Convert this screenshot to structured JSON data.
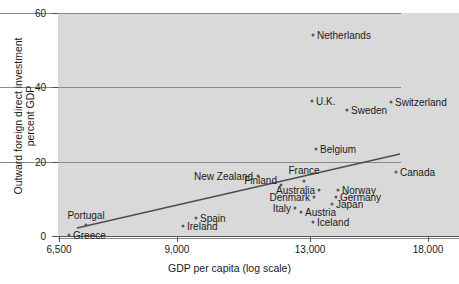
{
  "chart_data": {
    "type": "scatter",
    "title": "",
    "xlabel": "GDP per capita (log scale)",
    "ylabel": "Outward foreign direct investment\npercent GDP",
    "ylabel_line1": "Outward foreign direct investment",
    "ylabel_line2": "percent GDP",
    "xscale": "log",
    "xlim": [
      6500,
      19800
    ],
    "ylim": [
      0,
      60
    ],
    "xticks": [
      6500,
      9000,
      13000,
      18000
    ],
    "xticklabels": [
      "6,500",
      "9,000",
      "13,000",
      "18,000"
    ],
    "yticks": [
      0,
      20,
      40,
      60
    ],
    "yticklabels": [
      "0",
      "20",
      "40",
      "60"
    ],
    "grid": "horizontal",
    "legend": "none",
    "points": [
      {
        "label": "Netherlands",
        "x": 13000,
        "y": 54.0,
        "lx": 313,
        "ly": 35,
        "tx": 317,
        "ty": 35,
        "anchor": "l"
      },
      {
        "label": "U.K.",
        "x": 12970,
        "y": 36.3,
        "lx": 312,
        "ly": 101,
        "tx": 316,
        "ty": 101,
        "anchor": "l"
      },
      {
        "label": "Switzerland",
        "x": 16480,
        "y": 36.0,
        "lx": 391,
        "ly": 102,
        "tx": 395,
        "ty": 102,
        "anchor": "l"
      },
      {
        "label": "Sweden",
        "x": 14320,
        "y": 33.9,
        "lx": 347,
        "ly": 110,
        "tx": 351,
        "ty": 110,
        "anchor": "l"
      },
      {
        "label": "Belgium",
        "x": 13120,
        "y": 23.4,
        "lx": 316,
        "ly": 149,
        "tx": 320,
        "ty": 149,
        "anchor": "l"
      },
      {
        "label": "New Zealand",
        "x": 11090,
        "y": 16.1,
        "lx": 258,
        "ly": 176,
        "tx": 253,
        "ty": 176,
        "anchor": "r"
      },
      {
        "label": "Canada",
        "x": 16790,
        "y": 17.2,
        "lx": 396,
        "ly": 172,
        "tx": 400,
        "ty": 172,
        "anchor": "l"
      },
      {
        "label": "France",
        "x": 12650,
        "y": 14.8,
        "lx": 304,
        "ly": 181,
        "tx": 304,
        "ty": 170,
        "anchor": "c"
      },
      {
        "label": "Finland",
        "x": 11760,
        "y": 13.7,
        "lx": 281,
        "ly": 185,
        "tx": 277,
        "ty": 180,
        "anchor": "r"
      },
      {
        "label": "Australia",
        "x": 13250,
        "y": 12.4,
        "lx": 319,
        "ly": 190,
        "tx": 315,
        "ty": 190,
        "anchor": "r"
      },
      {
        "label": "Norway",
        "x": 13930,
        "y": 12.4,
        "lx": 338,
        "ly": 190,
        "tx": 342,
        "ty": 190,
        "anchor": "l"
      },
      {
        "label": "Denmark",
        "x": 13060,
        "y": 10.5,
        "lx": 314,
        "ly": 197,
        "tx": 310,
        "ty": 197,
        "anchor": "r"
      },
      {
        "label": "Germany",
        "x": 13850,
        "y": 10.5,
        "lx": 336,
        "ly": 197,
        "tx": 340,
        "ty": 197,
        "anchor": "l"
      },
      {
        "label": "Japan",
        "x": 13700,
        "y": 8.6,
        "lx": 332,
        "ly": 204,
        "tx": 336,
        "ty": 204,
        "anchor": "l"
      },
      {
        "label": "Italy",
        "x": 12320,
        "y": 7.5,
        "lx": 295,
        "ly": 208,
        "tx": 291,
        "ty": 208,
        "anchor": "r"
      },
      {
        "label": "Austria",
        "x": 12530,
        "y": 6.5,
        "lx": 301,
        "ly": 212,
        "tx": 305,
        "ty": 212,
        "anchor": "l"
      },
      {
        "label": "Iceland",
        "x": 13020,
        "y": 3.8,
        "lx": 313,
        "ly": 222,
        "tx": 317,
        "ty": 222,
        "anchor": "l"
      },
      {
        "label": "Spain",
        "x": 9590,
        "y": 4.8,
        "lx": 196,
        "ly": 218,
        "tx": 200,
        "ty": 218,
        "anchor": "l"
      },
      {
        "label": "Ireland",
        "x": 9130,
        "y": 2.7,
        "lx": 183,
        "ly": 226,
        "tx": 187,
        "ty": 226,
        "anchor": "l"
      },
      {
        "label": "Portugal",
        "x": 7430,
        "y": 3.0,
        "lx": 86,
        "ly": 225,
        "tx": 86,
        "ty": 215,
        "anchor": "c"
      },
      {
        "label": "Greece",
        "x": 6800,
        "y": 0.3,
        "lx": 69,
        "ly": 235,
        "tx": 73,
        "ty": 235,
        "anchor": "l"
      }
    ],
    "trendline": {
      "x0": 77,
      "y0": 228,
      "x1": 400,
      "y1": 154
    }
  }
}
